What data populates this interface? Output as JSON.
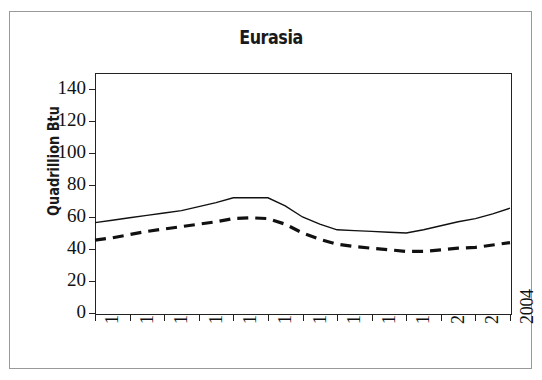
{
  "figure": {
    "title": "Eurasia",
    "ylabel": "Quadrillion Btu",
    "background_color": "#ffffff",
    "border_color": "#999999",
    "axis_color": "#222222"
  },
  "chart_data": {
    "type": "line",
    "title": "Eurasia",
    "xlabel": "",
    "ylabel": "Quadrillion Btu",
    "x": [
      1980,
      1981,
      1982,
      1983,
      1984,
      1985,
      1986,
      1987,
      1988,
      1989,
      1990,
      1991,
      1992,
      1993,
      1994,
      1995,
      1996,
      1997,
      1998,
      1999,
      2000,
      2001,
      2002,
      2003,
      2004
    ],
    "xlim": [
      1980,
      2004
    ],
    "ylim": [
      0,
      150
    ],
    "xticks": [
      1980,
      1982,
      1984,
      1986,
      1988,
      1990,
      1992,
      1994,
      1996,
      1998,
      2000,
      2002,
      2004
    ],
    "xticklabels": [
      "1980",
      "1982",
      "1984",
      "1986",
      "1988",
      "1990",
      "1992",
      "1994",
      "1996",
      "1998",
      "2000",
      "2002",
      "2004"
    ],
    "yticks": [
      0,
      20,
      40,
      60,
      80,
      100,
      120,
      140
    ],
    "yticklabels": [
      "0",
      "20",
      "40",
      "60",
      "80",
      "100",
      "120",
      "140"
    ],
    "grid": false,
    "legend": null,
    "series": [
      {
        "name": "Production",
        "style": "solid",
        "color": "#111111",
        "linewidth": 1.4,
        "values": [
          56.5,
          58.0,
          59.5,
          61.0,
          62.5,
          64.0,
          66.5,
          69.0,
          72.0,
          72.0,
          72.0,
          67.0,
          60.0,
          55.5,
          52.0,
          51.5,
          51.0,
          50.5,
          50.0,
          52.0,
          54.5,
          57.0,
          59.0,
          62.0,
          65.5
        ]
      },
      {
        "name": "Consumption",
        "style": "dashed",
        "color": "#111111",
        "linewidth": 3.2,
        "values": [
          45.5,
          47.0,
          49.0,
          51.0,
          52.5,
          54.0,
          55.5,
          57.0,
          59.0,
          59.5,
          59.0,
          55.5,
          50.0,
          46.0,
          43.0,
          41.5,
          40.5,
          39.5,
          38.5,
          38.5,
          39.5,
          40.5,
          41.0,
          42.5,
          44.0
        ]
      }
    ]
  }
}
